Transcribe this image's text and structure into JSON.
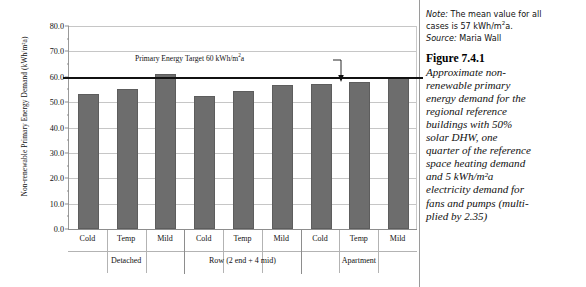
{
  "chart_data": {
    "type": "bar",
    "title": "",
    "xlabel": "",
    "ylabel": "Non-renewable Primary Energy Demand (kWh/m²a)",
    "ylim": [
      0,
      80
    ],
    "ytick_step": 10,
    "ytick_labels": [
      "0.0",
      "10.0",
      "20.0",
      "30.0",
      "40.0",
      "50.0",
      "60.0",
      "70.0",
      "80.0"
    ],
    "grid": true,
    "legend": "none",
    "bar_color": "#6d6d6d",
    "categories": [
      "Cold",
      "Temp",
      "Mild",
      "Cold",
      "Temp",
      "Mild",
      "Cold",
      "Temp",
      "Mild"
    ],
    "values": [
      53.2,
      55.1,
      61.0,
      52.4,
      54.4,
      56.6,
      57.0,
      57.9,
      59.6
    ],
    "groups": [
      {
        "label": "Detached",
        "categories": [
          "Cold",
          "Temp",
          "Mild"
        ],
        "values": [
          53.2,
          55.1,
          61.0
        ]
      },
      {
        "label": "Row (2 end + 4 mid)",
        "categories": [
          "Cold",
          "Temp",
          "Mild"
        ],
        "values": [
          52.4,
          54.4,
          56.6
        ]
      },
      {
        "label": "Apartment",
        "categories": [
          "Cold",
          "Temp",
          "Mild"
        ],
        "values": [
          57.0,
          57.9,
          59.6
        ]
      }
    ],
    "annotations": [
      {
        "name": "primary-energy-target",
        "text": "Primary Energy Target 60 kWh/m²a",
        "value": 60.0,
        "kind": "reference-line-with-arrow",
        "color": "#111111"
      }
    ]
  },
  "chart": {
    "y_axis_title": "Non-renewable Primary Energy Demand (kWh/m²a)",
    "target_label_prefix": "Primary Energy Target 60 kWh/m",
    "target_label_suffix": "a"
  },
  "text_panel": {
    "note_label": "Note:",
    "note_text_line1": " The mean value for all",
    "note_text_line2": "cases is 57 kWh/m",
    "note_text_line2_sup": "2",
    "note_text_line2_tail": "a.",
    "source_label": "Source:",
    "source_text": " Maria Wall",
    "figure_number": "Figure 7.4.1",
    "caption_lines": [
      "Approximate non-",
      "renewable primary",
      "energy demand for the",
      "regional reference",
      "buildings with 50%",
      "solar DHW, one",
      "quarter of the reference",
      "space heating demand",
      "and 5 kWh/m²a",
      "electricity demand for",
      "fans and pumps (multi-",
      "plied by 2.35)"
    ]
  }
}
